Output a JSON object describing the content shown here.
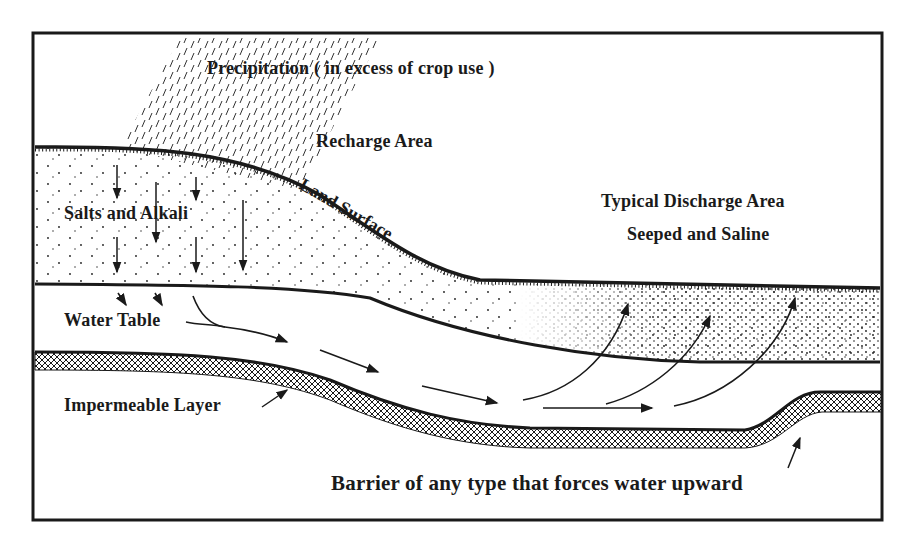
{
  "diagram": {
    "labels": {
      "precipitation": "Precipitation  ( in excess of crop use )",
      "recharge_area": "Recharge Area",
      "land_surface": "Land Surface",
      "salts_alkali": "Salts and Alkali",
      "discharge_area_line1": "Typical Discharge Area",
      "discharge_area_line2": "Seeped and Saline",
      "water_table": "Water Table",
      "impermeable_layer": "Impermeable Layer",
      "barrier": "Barrier of any type that forces water upward"
    },
    "colors": {
      "ink": "#1a1a1a",
      "background": "#ffffff"
    }
  }
}
